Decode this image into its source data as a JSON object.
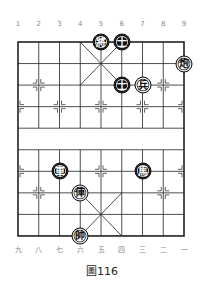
{
  "board": {
    "top_labels": [
      "1",
      "2",
      "3",
      "4",
      "5",
      "6",
      "7",
      "8",
      "9"
    ],
    "bottom_labels": [
      "九",
      "八",
      "七",
      "六",
      "五",
      "四",
      "三",
      "二",
      "一"
    ],
    "caption": "圖116",
    "pieces": [
      {
        "char": "將",
        "side": "black",
        "col": 4,
        "row": 0,
        "name": "black-general"
      },
      {
        "char": "士",
        "side": "black",
        "col": 5,
        "row": 0,
        "name": "black-advisor"
      },
      {
        "char": "炮",
        "side": "red",
        "col": 8,
        "row": 1,
        "name": "red-cannon"
      },
      {
        "char": "士",
        "side": "black",
        "col": 5,
        "row": 2,
        "name": "black-advisor"
      },
      {
        "char": "兵",
        "side": "red",
        "col": 6,
        "row": 2,
        "name": "red-soldier"
      },
      {
        "char": "車",
        "side": "black",
        "col": 2,
        "row": 6,
        "name": "black-chariot"
      },
      {
        "char": "馬",
        "side": "black",
        "col": 6,
        "row": 6,
        "name": "black-horse"
      },
      {
        "char": "俥",
        "side": "red",
        "col": 3,
        "row": 7,
        "name": "red-chariot"
      },
      {
        "char": "帥",
        "side": "red",
        "col": 3,
        "row": 9,
        "name": "red-general"
      }
    ]
  }
}
